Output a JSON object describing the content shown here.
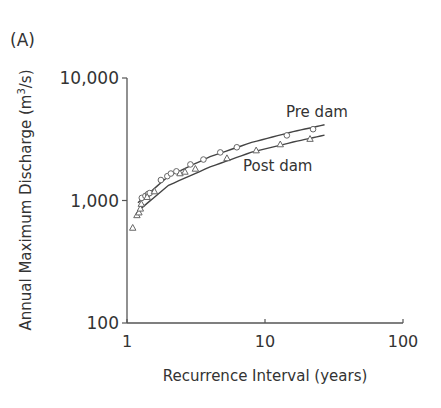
{
  "panel_label": "(A)",
  "chart_data": {
    "type": "scatter",
    "title": "",
    "xlabel": "Recurrence Interval (years)",
    "ylabel": "Annual Maximum Discharge (m³/s)",
    "ylabel_parts": {
      "main": "Annual Maximum Discharge (m",
      "sup": "3",
      "tail": "/s)"
    },
    "xscale": "log",
    "yscale": "log",
    "xlim": [
      1,
      100
    ],
    "ylim": [
      100,
      10000
    ],
    "xticks": [
      1,
      10,
      100
    ],
    "xtick_labels": [
      "1",
      "10",
      "100"
    ],
    "yticks": [
      100,
      1000,
      10000
    ],
    "ytick_labels": [
      "100",
      "1,000",
      "10,000"
    ],
    "grid": false,
    "legend": "inline annotations",
    "series": [
      {
        "name": "Pre dam",
        "marker": "circle",
        "annotation": "Pre dam",
        "points": [
          [
            1.28,
            1050
          ],
          [
            1.36,
            1090
          ],
          [
            1.42,
            1130
          ],
          [
            1.46,
            1150
          ],
          [
            1.76,
            1470
          ],
          [
            1.96,
            1580
          ],
          [
            2.08,
            1660
          ],
          [
            2.28,
            1730
          ],
          [
            2.88,
            1970
          ],
          [
            3.58,
            2160
          ],
          [
            4.74,
            2470
          ],
          [
            6.25,
            2720
          ],
          [
            14.4,
            3400
          ],
          [
            22.3,
            3820
          ]
        ],
        "fit": [
          [
            1.2,
            960
          ],
          [
            2,
            1580
          ],
          [
            4,
            2280
          ],
          [
            8,
            2980
          ],
          [
            16,
            3650
          ],
          [
            27,
            4150
          ]
        ]
      },
      {
        "name": "Post dam",
        "marker": "triangle",
        "annotation": "Post dam",
        "points": [
          [
            1.1,
            600
          ],
          [
            1.18,
            760
          ],
          [
            1.22,
            800
          ],
          [
            1.25,
            860
          ],
          [
            1.27,
            940
          ],
          [
            1.4,
            1070
          ],
          [
            1.58,
            1190
          ],
          [
            2.42,
            1670
          ],
          [
            2.63,
            1720
          ],
          [
            3.13,
            1820
          ],
          [
            5.3,
            2220
          ],
          [
            8.63,
            2570
          ],
          [
            12.9,
            2880
          ],
          [
            21.2,
            3190
          ]
        ],
        "fit": [
          [
            1.2,
            820
          ],
          [
            2,
            1330
          ],
          [
            4,
            1880
          ],
          [
            8,
            2480
          ],
          [
            16,
            3000
          ],
          [
            27,
            3420
          ]
        ]
      }
    ]
  }
}
